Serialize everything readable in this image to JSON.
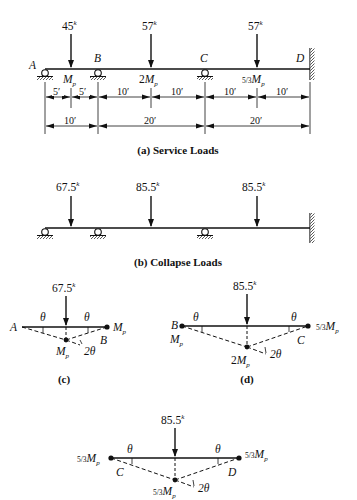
{
  "figure": {
    "a": {
      "caption": "(a) Service Loads",
      "loads": [
        {
          "value": "45",
          "unit": "k",
          "x": 71
        },
        {
          "value": "57",
          "unit": "k",
          "x": 151
        },
        {
          "value": "57",
          "unit": "k",
          "x": 257
        }
      ],
      "joints": [
        {
          "label": "A",
          "x": 45,
          "type": "roller"
        },
        {
          "label": "B",
          "x": 98,
          "type": "roller"
        },
        {
          "label": "C",
          "x": 205,
          "type": "roller"
        },
        {
          "label": "D",
          "x": 310,
          "type": "fixed"
        }
      ],
      "moment_capacities": [
        {
          "coef": "",
          "label": "M",
          "sub": "p",
          "x": 71
        },
        {
          "coef": "2",
          "label": "M",
          "sub": "p",
          "x": 151
        },
        {
          "coef": "5/3",
          "label": "M",
          "sub": "p",
          "x": 257
        }
      ],
      "dims_row1": [
        "5′",
        "5′",
        "10′",
        "10′",
        "10′",
        "10′"
      ],
      "dims_row2": [
        "10′",
        "20′",
        "20′"
      ]
    },
    "b": {
      "caption": "(b) Collapse Loads",
      "loads": [
        {
          "value": "67.5",
          "unit": "k"
        },
        {
          "value": "85.5",
          "unit": "k"
        },
        {
          "value": "85.5",
          "unit": "k"
        }
      ]
    },
    "c": {
      "caption": "(c)",
      "load": "67.5",
      "unit": "k",
      "left": "A",
      "right": "B",
      "right_moment": "M",
      "center_moment": "M",
      "sub": "p",
      "theta": "θ",
      "two_theta": "2θ"
    },
    "d": {
      "caption": "(d)",
      "load": "85.5",
      "unit": "k",
      "left": "B",
      "right": "C",
      "left_moment": "M",
      "center_coef": "2",
      "right_coef": "5/3",
      "sub": "p",
      "theta": "θ",
      "two_theta": "2θ"
    },
    "e": {
      "load": "85.5",
      "unit": "k",
      "left": "C",
      "right": "D",
      "coef": "5/3",
      "sub": "p",
      "theta": "θ",
      "two_theta": "2θ"
    }
  }
}
